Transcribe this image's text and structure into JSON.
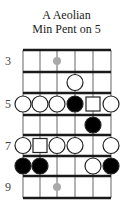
{
  "diagram": {
    "title_line1": "A Aeolian",
    "title_line2": "Min Pent on 5",
    "fret_labels": [
      {
        "label": "3",
        "row": 0
      },
      {
        "label": "5",
        "row": 2
      },
      {
        "label": "7",
        "row": 4
      },
      {
        "label": "9",
        "row": 6
      }
    ],
    "strings": 6,
    "frets_shown": 7,
    "start_fret": 3,
    "markers": [
      {
        "type": "inlay",
        "fret": 3,
        "string": 3,
        "color": "#aaaaaa"
      },
      {
        "type": "open-circle",
        "fret": 4,
        "string": 4
      },
      {
        "type": "open-circle",
        "fret": 5,
        "string": 1
      },
      {
        "type": "open-circle",
        "fret": 5,
        "string": 2
      },
      {
        "type": "open-circle",
        "fret": 5,
        "string": 3
      },
      {
        "type": "filled-circle",
        "fret": 5,
        "string": 4
      },
      {
        "type": "square",
        "fret": 5,
        "string": 5
      },
      {
        "type": "open-circle",
        "fret": 5,
        "string": 6
      },
      {
        "type": "filled-circle",
        "fret": 6,
        "string": 5
      },
      {
        "type": "open-circle",
        "fret": 7,
        "string": 1
      },
      {
        "type": "square",
        "fret": 7,
        "string": 2
      },
      {
        "type": "open-circle",
        "fret": 7,
        "string": 3
      },
      {
        "type": "open-circle",
        "fret": 7,
        "string": 4
      },
      {
        "type": "open-circle",
        "fret": 7,
        "string": 6
      },
      {
        "type": "filled-circle",
        "fret": 8,
        "string": 1
      },
      {
        "type": "filled-circle",
        "fret": 8,
        "string": 2
      },
      {
        "type": "open-circle",
        "fret": 8,
        "string": 5
      },
      {
        "type": "filled-circle",
        "fret": 8,
        "string": 6
      },
      {
        "type": "inlay",
        "fret": 9,
        "string": 3,
        "color": "#aaaaaa"
      }
    ],
    "colors": {
      "fret_line": "#1a1a1a",
      "string_line": "#999999",
      "note_fill_filled": "#000000",
      "note_fill_open": "#ffffff",
      "note_stroke": "#222222"
    }
  }
}
